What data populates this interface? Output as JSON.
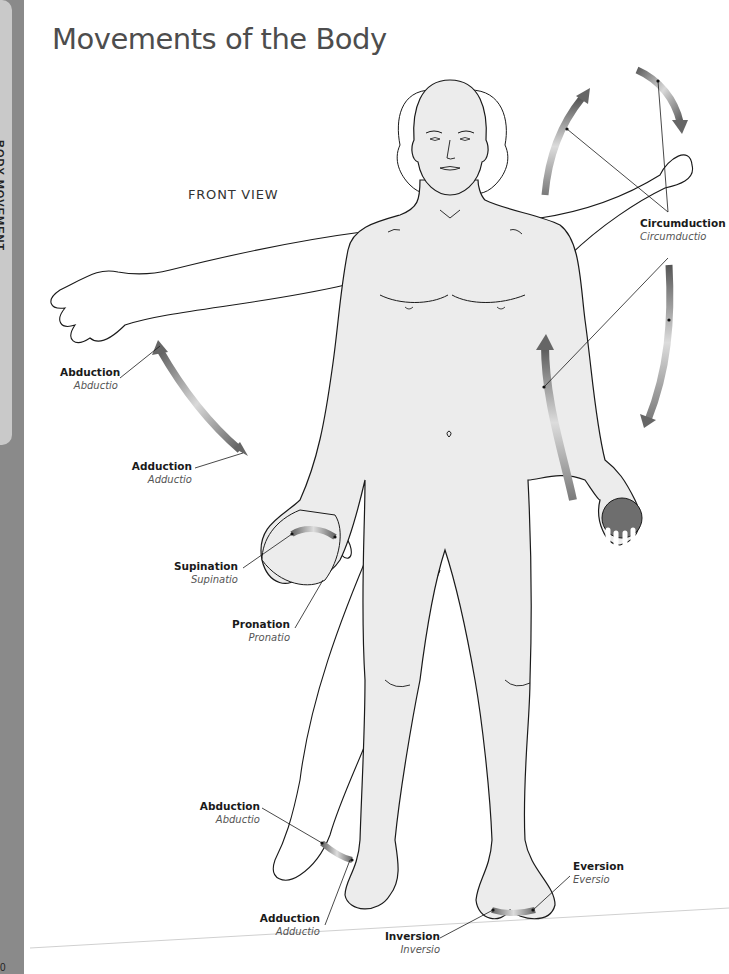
{
  "page": {
    "title": "Movements of the Body",
    "view_label": "FRONT VIEW",
    "side_tab": {
      "label": "BODY MOVEMENT"
    },
    "page_number": "0"
  },
  "labels": [
    {
      "id": "circumduction",
      "en": "Circumduction",
      "la": "Circumductio"
    },
    {
      "id": "abduction-arm",
      "en": "Abduction",
      "la": "Abductio"
    },
    {
      "id": "adduction-arm",
      "en": "Adduction",
      "la": "Adductio"
    },
    {
      "id": "supination",
      "en": "Supination",
      "la": "Supinatio"
    },
    {
      "id": "pronation",
      "en": "Pronation",
      "la": "Pronatio"
    },
    {
      "id": "abduction-leg",
      "en": "Abduction",
      "la": "Abductio"
    },
    {
      "id": "adduction-leg",
      "en": "Adduction",
      "la": "Adductio"
    },
    {
      "id": "eversion",
      "en": "Eversion",
      "la": "Eversio"
    },
    {
      "id": "inversion",
      "en": "Inversion",
      "la": "Inversio"
    }
  ],
  "colors": {
    "skin": "#ececec",
    "outline": "#1a1a1a",
    "arrow_dark": "#6b6b6b",
    "arrow_light": "#d8d8d8",
    "ball": "#6e6e6e",
    "sidebar": "#8a8a8a"
  }
}
